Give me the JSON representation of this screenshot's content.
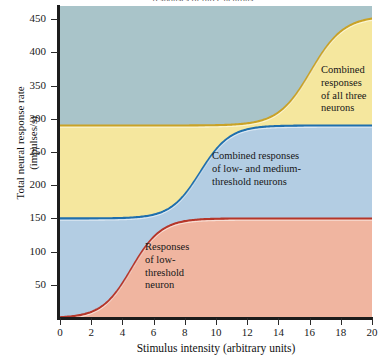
{
  "figure": {
    "title_fragment": "responses of three neurons"
  },
  "chart_data": {
    "type": "area",
    "title": "",
    "xlabel": "Stimulus intensity (arbitrary units)",
    "ylabel": "Total neural response rate (impulses/s)",
    "xlim": [
      0,
      20
    ],
    "ylim": [
      0,
      470
    ],
    "xticks": [
      0,
      2,
      4,
      6,
      8,
      10,
      12,
      14,
      16,
      18,
      20
    ],
    "yticks": [
      50,
      100,
      150,
      200,
      250,
      300,
      350,
      400,
      450
    ],
    "grid": false,
    "legend": "none",
    "stacked": true,
    "series": [
      {
        "name": "Responses of low-threshold neuron",
        "fill_color": "#f0b5a0",
        "line_color": "#b5362a",
        "plateau": 150,
        "midpoint_x": 4.6,
        "steepness": 1.05,
        "x": [
          0,
          1,
          2,
          3,
          4,
          5,
          6,
          7,
          8,
          9,
          10,
          12,
          14,
          16,
          18,
          20
        ],
        "y": [
          0,
          3,
          10,
          29,
          67,
          110,
          137,
          147,
          150,
          150,
          150,
          150,
          150,
          150,
          150,
          150
        ]
      },
      {
        "name": "Combined responses of low- and medium-threshold neurons",
        "fill_color": "#b3cde3",
        "line_color": "#1f6fad",
        "plateau": 290,
        "midpoint_x": 9.0,
        "steepness": 1.05,
        "x": [
          0,
          2,
          4,
          6,
          7,
          8,
          9,
          10,
          11,
          12,
          14,
          16,
          18,
          20
        ],
        "y": [
          150,
          150,
          152,
          160,
          180,
          215,
          255,
          277,
          287,
          290,
          290,
          290,
          290,
          290
        ]
      },
      {
        "name": "Combined responses of all three neurons",
        "fill_color": "#f5e79e",
        "line_color": "#c9a227",
        "plateau": 455,
        "midpoint_x": 16.1,
        "steepness": 0.95,
        "x": [
          0,
          10,
          12,
          13,
          14,
          15,
          16,
          17,
          18,
          19,
          20
        ],
        "y": [
          290,
          290,
          293,
          300,
          320,
          362,
          410,
          442,
          453,
          455,
          455
        ]
      }
    ],
    "annotations": [
      {
        "id": "low",
        "text": "Responses\nof low-\nthreshold\nneuron",
        "x_px": 145,
        "y_px": 241
      },
      {
        "id": "low-medium",
        "text": "Combined responses\nof low- and medium-\nthreshold neurons",
        "x_px": 212,
        "y_px": 150
      },
      {
        "id": "all-three",
        "text": "Combined\nresponses\nof all three\nneurons",
        "x_px": 321,
        "y_px": 64
      }
    ],
    "background_color": "#a9c4c9"
  }
}
